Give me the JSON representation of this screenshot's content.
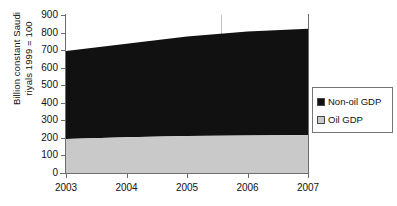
{
  "chart_data": {
    "type": "area",
    "stacked": true,
    "title": "",
    "xlabel": "",
    "ylabel": "Billion constant Saudi riyals 1999 = 100",
    "ylabel_lines": [
      "Billion constant Saudi",
      "riyals 1999 = 100"
    ],
    "x": [
      2003,
      2004,
      2005,
      2006,
      2007
    ],
    "xtick_labels": [
      "2003",
      "2004",
      "2005",
      "2006",
      "2007"
    ],
    "xlim": [
      2003,
      2007
    ],
    "ylim": [
      0,
      900
    ],
    "ytick_labels": [
      "900",
      "800",
      "700",
      "600",
      "500",
      "400",
      "300",
      "200",
      "100",
      "0"
    ],
    "yticks": [
      900,
      800,
      700,
      600,
      500,
      400,
      300,
      200,
      100,
      0
    ],
    "ystep": 100,
    "grid": false,
    "legend_position": "right",
    "series": [
      {
        "name": "Oil GDP",
        "color": "#c9c9c9",
        "values": [
          193,
          203,
          211,
          214,
          216
        ]
      },
      {
        "name": "Non-oil GDP",
        "color": "#111111",
        "values": [
          502,
          533,
          566,
          592,
          606
        ]
      }
    ],
    "totals": [
      695,
      736,
      777,
      806,
      822
    ],
    "annotations": []
  },
  "legend": {
    "items": [
      {
        "label": "Non-oil GDP",
        "color": "#111111"
      },
      {
        "label": "Oil GDP",
        "color": "#c9c9c9"
      }
    ]
  },
  "axis": {
    "line_color": "#6e6e6e"
  }
}
